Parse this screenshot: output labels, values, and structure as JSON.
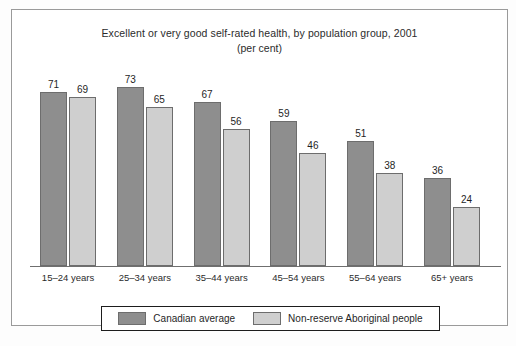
{
  "chart_data": {
    "type": "bar",
    "title": "Excellent or very good self-rated health, by population group, 2001",
    "subtitle": "(per cent)",
    "xlabel": "",
    "ylabel": "",
    "ylim": [
      0,
      80
    ],
    "grid": false,
    "legend_position": "bottom",
    "categories": [
      "15–24 years",
      "25–34 years",
      "35–44 years",
      "45–54 years",
      "55–64 years",
      "65+ years"
    ],
    "series": [
      {
        "name": "Canadian average",
        "color": "#8e8e8e",
        "values": [
          71,
          73,
          67,
          59,
          51,
          36
        ]
      },
      {
        "name": "Non-reserve Aboriginal people",
        "color": "#cfcfcf",
        "values": [
          69,
          65,
          56,
          46,
          38,
          24
        ]
      }
    ]
  },
  "legend": {
    "items": [
      {
        "label": "Canadian average",
        "color": "#8e8e8e"
      },
      {
        "label": "Non-reserve Aboriginal people",
        "color": "#cfcfcf"
      }
    ]
  },
  "caption": ""
}
